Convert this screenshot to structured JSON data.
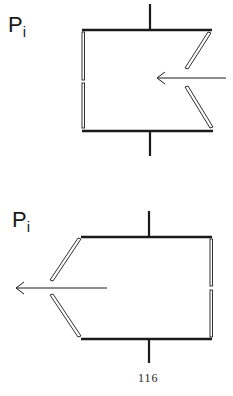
{
  "figures": [
    {
      "label_main": "P",
      "label_sub": "i",
      "arrow_direction": "left",
      "opening_side": "right"
    },
    {
      "label_main": "P",
      "label_sub": "i",
      "arrow_direction": "left",
      "opening_side": "left"
    }
  ],
  "page_number": "116",
  "colors": {
    "stroke": "#1a1a1a",
    "background": "#ffffff"
  }
}
